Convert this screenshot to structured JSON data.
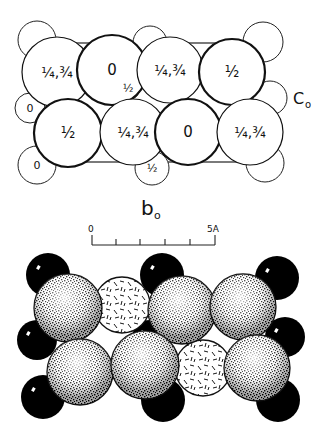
{
  "figure": {
    "top_diagram": {
      "axis_right_label": "C",
      "axis_right_sub": "o",
      "axis_bottom_label": "b",
      "axis_bottom_sub": "o",
      "cell_outline": {
        "x1": 70,
        "y1": 43,
        "x2": 250,
        "y2": 162
      },
      "large_atoms": [
        {
          "cx": 57,
          "cy": 72,
          "r": 35,
          "label": "1/4,3/4"
        },
        {
          "cx": 112,
          "cy": 70,
          "r": 35,
          "label": "0"
        },
        {
          "cx": 170,
          "cy": 70,
          "r": 33,
          "label": "1/4,3/4"
        },
        {
          "cx": 232,
          "cy": 72,
          "r": 33,
          "label": "1/2"
        },
        {
          "cx": 68,
          "cy": 133,
          "r": 34,
          "label": "1/2"
        },
        {
          "cx": 133,
          "cy": 132,
          "r": 33,
          "label": "1/4,3/4"
        },
        {
          "cx": 188,
          "cy": 132,
          "r": 33,
          "label": "0"
        },
        {
          "cx": 250,
          "cy": 132,
          "r": 33,
          "label": "1/4,3/4"
        }
      ],
      "small_atoms": [
        {
          "cx": 37,
          "cy": 40,
          "r": 19,
          "label": ""
        },
        {
          "cx": 30,
          "cy": 108,
          "r": 15,
          "label": "0"
        },
        {
          "cx": 37,
          "cy": 165,
          "r": 19,
          "label": "0"
        },
        {
          "cx": 150,
          "cy": 43,
          "r": 17,
          "label": ""
        },
        {
          "cx": 128,
          "cy": 88,
          "r": 12,
          "label": "1/2"
        },
        {
          "cx": 152,
          "cy": 168,
          "r": 17,
          "label": "1/2"
        },
        {
          "cx": 263,
          "cy": 42,
          "r": 20,
          "label": ""
        },
        {
          "cx": 270,
          "cy": 98,
          "r": 17,
          "label": ""
        },
        {
          "cx": 265,
          "cy": 163,
          "r": 19,
          "label": ""
        }
      ]
    },
    "scale_bar": {
      "start_label": "0",
      "end_label": "5A",
      "x_start": 92,
      "x_end": 215,
      "y": 245,
      "ticks": [
        92,
        116,
        140,
        165,
        190,
        215
      ]
    },
    "bottom_diagram": {
      "black_atoms": [
        {
          "cx": 48,
          "cy": 275,
          "r": 22
        },
        {
          "cx": 162,
          "cy": 275,
          "r": 22
        },
        {
          "cx": 277,
          "cy": 278,
          "r": 22
        },
        {
          "cx": 37,
          "cy": 340,
          "r": 20
        },
        {
          "cx": 150,
          "cy": 338,
          "r": 18
        },
        {
          "cx": 285,
          "cy": 337,
          "r": 20
        },
        {
          "cx": 43,
          "cy": 397,
          "r": 22
        },
        {
          "cx": 163,
          "cy": 400,
          "r": 22
        },
        {
          "cx": 278,
          "cy": 400,
          "r": 22
        }
      ],
      "hatched_atoms": [
        {
          "cx": 122,
          "cy": 305,
          "r": 28
        },
        {
          "cx": 203,
          "cy": 368,
          "r": 28
        }
      ],
      "stippled_atoms": [
        {
          "cx": 68,
          "cy": 308,
          "r": 34
        },
        {
          "cx": 182,
          "cy": 310,
          "r": 34
        },
        {
          "cx": 243,
          "cy": 307,
          "r": 33
        },
        {
          "cx": 80,
          "cy": 372,
          "r": 33
        },
        {
          "cx": 145,
          "cy": 365,
          "r": 34
        },
        {
          "cx": 257,
          "cy": 368,
          "r": 33
        }
      ]
    }
  }
}
